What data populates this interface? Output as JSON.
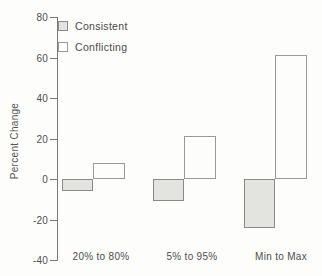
{
  "figure": {
    "background": "#fdfdfb",
    "axis_color": "#7a7a7a",
    "text_color": "#4f4f4f"
  },
  "chart_data": {
    "type": "bar",
    "title": "",
    "xlabel": "",
    "ylabel": "Percent Change",
    "categories": [
      "20% to 80%",
      "5% to 95%",
      "Min to Max"
    ],
    "series": [
      {
        "name": "Consistent",
        "fill": "#e3e3e0",
        "border": "#8a8a8a",
        "values": [
          -6,
          -11,
          -24
        ]
      },
      {
        "name": "Conflicting",
        "fill": "#fdfdfb",
        "border": "#9a9a9a",
        "values": [
          8,
          21,
          61
        ]
      }
    ],
    "ylim": [
      -40,
      80
    ],
    "yticks": [
      80,
      60,
      40,
      20,
      0,
      -20,
      -40
    ],
    "ytick_labels": [
      "80",
      "60",
      "40",
      "20",
      "0",
      "-20",
      "-40"
    ],
    "legend_position": "top-left",
    "grid": false,
    "baseline": 0
  }
}
